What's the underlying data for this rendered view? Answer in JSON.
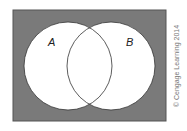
{
  "diagram": {
    "type": "venn",
    "universe_color": "#7a7a7a",
    "sets": [
      {
        "label": "A",
        "cx": 68,
        "cy": 66,
        "r": 44
      },
      {
        "label": "B",
        "cx": 111,
        "cy": 66,
        "r": 44
      }
    ]
  },
  "credit": "© Cengage Learning 2014"
}
